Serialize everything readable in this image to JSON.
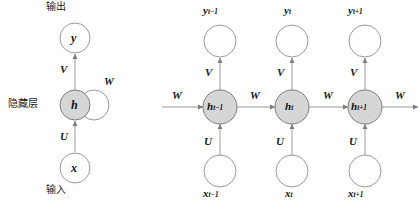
{
  "diagram": {
    "colors": {
      "hidden_node_fill": "#d6d6d6",
      "node_stroke": "#8c8c8c",
      "edge": "#8c8c8c",
      "text": "#1a1a1a",
      "background": "#ffffff"
    }
  },
  "folded": {
    "top_label": "输出",
    "side_label": "隐藏层",
    "bottom_label": "输入",
    "output_node": "y",
    "hidden_node": "h",
    "input_node": "x",
    "weight_output": "V",
    "weight_input": "U",
    "weight_recurrent": "W"
  },
  "unfolded": {
    "weight_output": "V",
    "weight_input": "U",
    "weight_recurrent": "W",
    "incoming_weight": "W",
    "outgoing_weight": "W",
    "steps": [
      {
        "id": "t-minus-1",
        "output_base": "y",
        "output_sub": "t−1",
        "hidden_base": "h",
        "hidden_sub": "t−1",
        "input_base": "x",
        "input_sub": "t−1",
        "weight_output": "V",
        "weight_input": "U",
        "weight_recurrent_out": "W"
      },
      {
        "id": "t",
        "output_base": "y",
        "output_sub": "t",
        "hidden_base": "h",
        "hidden_sub": "t",
        "input_base": "x",
        "input_sub": "t",
        "weight_output": "V",
        "weight_input": "U",
        "weight_recurrent_out": "W"
      },
      {
        "id": "t-plus-1",
        "output_base": "y",
        "output_sub": "t+1",
        "hidden_base": "h",
        "hidden_sub": "t+1",
        "input_base": "x",
        "input_sub": "t+1",
        "weight_output": "V",
        "weight_input": "U",
        "weight_recurrent_out": "W"
      }
    ]
  }
}
